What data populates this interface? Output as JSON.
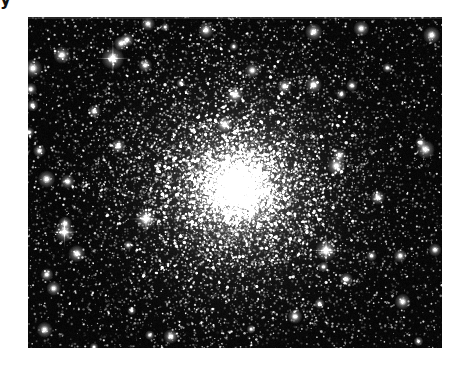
{
  "page": {
    "background_color": "#ffffff",
    "width": 466,
    "height": 372
  },
  "caption": {
    "fragment_text": "y",
    "note": "descender of a clipped caption line above the figure"
  },
  "figure": {
    "name": "globular-cluster-photograph",
    "kind": "astronomical-image",
    "frame": {
      "x": 28,
      "y": 17,
      "width": 414,
      "height": 331
    },
    "background_color": "#000000",
    "star_color": "#ffffff",
    "core": {
      "center_x_fraction": 0.505,
      "center_y_fraction": 0.515,
      "peak_color": "#ffffff",
      "halo_color": "#d9d9d9",
      "core_radius_fraction": 0.085,
      "halo_radius_fraction": 0.46
    },
    "field": {
      "cluster_star_count": 17000,
      "field_star_count": 2600,
      "bright_star_count": 46,
      "noise_grain": 0.22
    },
    "bright_stars": [
      {
        "x_fraction": 0.205,
        "y_fraction": 0.125,
        "size": 3.4,
        "spikes": true
      },
      {
        "x_fraction": 0.082,
        "y_fraction": 0.115,
        "size": 2.6,
        "spikes": false
      },
      {
        "x_fraction": 0.012,
        "y_fraction": 0.155,
        "size": 2.8,
        "spikes": false
      },
      {
        "x_fraction": 0.43,
        "y_fraction": 0.04,
        "size": 2.4,
        "spikes": false
      },
      {
        "x_fraction": 0.69,
        "y_fraction": 0.045,
        "size": 2.6,
        "spikes": false
      },
      {
        "x_fraction": 0.805,
        "y_fraction": 0.035,
        "size": 2.4,
        "spikes": false
      },
      {
        "x_fraction": 0.975,
        "y_fraction": 0.055,
        "size": 2.6,
        "spikes": false
      },
      {
        "x_fraction": 0.69,
        "y_fraction": 0.205,
        "size": 2.5,
        "spikes": false
      },
      {
        "x_fraction": 0.225,
        "y_fraction": 0.08,
        "size": 2.2,
        "spikes": false
      },
      {
        "x_fraction": 0.045,
        "y_fraction": 0.49,
        "size": 2.6,
        "spikes": false
      },
      {
        "x_fraction": 0.088,
        "y_fraction": 0.65,
        "size": 3.0,
        "spikes": true
      },
      {
        "x_fraction": 0.118,
        "y_fraction": 0.715,
        "size": 2.6,
        "spikes": false
      },
      {
        "x_fraction": 0.285,
        "y_fraction": 0.61,
        "size": 3.2,
        "spikes": true
      },
      {
        "x_fraction": 0.96,
        "y_fraction": 0.4,
        "size": 2.8,
        "spikes": false
      },
      {
        "x_fraction": 0.745,
        "y_fraction": 0.45,
        "size": 2.8,
        "spikes": false
      },
      {
        "x_fraction": 0.72,
        "y_fraction": 0.705,
        "size": 3.2,
        "spikes": true
      },
      {
        "x_fraction": 0.905,
        "y_fraction": 0.86,
        "size": 2.4,
        "spikes": false
      },
      {
        "x_fraction": 0.04,
        "y_fraction": 0.945,
        "size": 2.4,
        "spikes": false
      },
      {
        "x_fraction": 0.345,
        "y_fraction": 0.965,
        "size": 2.2,
        "spikes": false
      },
      {
        "x_fraction": 0.645,
        "y_fraction": 0.905,
        "size": 2.2,
        "spikes": false
      },
      {
        "x_fraction": 0.5,
        "y_fraction": 0.235,
        "size": 2.6,
        "spikes": false
      },
      {
        "x_fraction": 0.475,
        "y_fraction": 0.325,
        "size": 2.4,
        "spikes": false
      },
      {
        "x_fraction": 0.218,
        "y_fraction": 0.39,
        "size": 2.2,
        "spikes": false
      },
      {
        "x_fraction": 0.845,
        "y_fraction": 0.545,
        "size": 2.2,
        "spikes": false
      },
      {
        "x_fraction": 0.16,
        "y_fraction": 0.285,
        "size": 2.0,
        "spikes": false
      },
      {
        "x_fraction": 0.062,
        "y_fraction": 0.82,
        "size": 2.2,
        "spikes": false
      }
    ]
  }
}
